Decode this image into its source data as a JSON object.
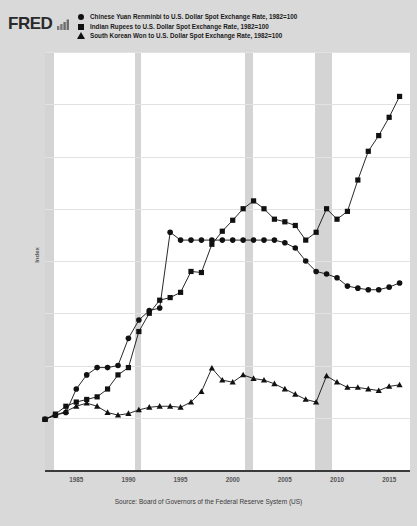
{
  "header": {
    "logo_text": "FRED",
    "logo_mark_icon": "mini-bar-chart-icon"
  },
  "legend": {
    "position": "top",
    "items": [
      {
        "marker": "circle",
        "label": "Chinese Yuan Renminbi to U.S. Dollar Spot Exchange Rate, 1982=100"
      },
      {
        "marker": "square",
        "label": "Indian Rupees to U.S. Dollar Spot Exchange Rate, 1982=100"
      },
      {
        "marker": "triangle",
        "label": "South Korean Won to U.S. Dollar Spot Exchange Rate, 1982=100"
      }
    ]
  },
  "source": {
    "text": "Source: Board of Governors of the Federal Reserve System (US)"
  },
  "chart_data": {
    "type": "line",
    "title": "",
    "xlabel": "",
    "ylabel": "Index",
    "xlim": [
      1982,
      2017
    ],
    "ylim": [
      0,
      800
    ],
    "grid": true,
    "legend_position": "top",
    "yticks": [
      0,
      100,
      200,
      300,
      400,
      500,
      600,
      700,
      800
    ],
    "xticks": [
      1985,
      1990,
      1995,
      2000,
      2005,
      2010,
      2015
    ],
    "marker_color": "#111111",
    "line_color": "#111111",
    "recession_color": "#d4d4d4",
    "recession_bands": [
      {
        "start": 1981.6,
        "end": 1982.9
      },
      {
        "start": 1990.6,
        "end": 1991.2
      },
      {
        "start": 2001.2,
        "end": 2001.9
      },
      {
        "start": 2007.9,
        "end": 2009.5
      }
    ],
    "x": [
      1982,
      1983,
      1984,
      1985,
      1986,
      1987,
      1988,
      1989,
      1990,
      1991,
      1992,
      1993,
      1994,
      1995,
      1996,
      1997,
      1998,
      1999,
      2000,
      2001,
      2002,
      2003,
      2004,
      2005,
      2006,
      2007,
      2008,
      2009,
      2010,
      2011,
      2012,
      2013,
      2014,
      2015,
      2016
    ],
    "series": [
      {
        "name": "Chinese Yuan Renminbi to U.S. Dollar Spot Exchange Rate, 1982=100",
        "marker": "circle",
        "values": [
          97,
          105,
          110,
          155,
          182,
          196,
          196,
          200,
          252,
          287,
          305,
          310,
          455,
          440,
          440,
          440,
          440,
          440,
          440,
          440,
          440,
          440,
          440,
          435,
          425,
          400,
          380,
          375,
          368,
          352,
          348,
          345,
          345,
          350,
          358
        ]
      },
      {
        "name": "Indian Rupees to U.S. Dollar Spot Exchange Rate, 1982=100",
        "marker": "square",
        "values": [
          97,
          107,
          122,
          130,
          135,
          140,
          155,
          182,
          196,
          265,
          300,
          325,
          330,
          340,
          380,
          378,
          432,
          457,
          478,
          500,
          515,
          500,
          480,
          475,
          468,
          440,
          455,
          500,
          480,
          495,
          555,
          610,
          640,
          675,
          715
        ]
      },
      {
        "name": "South Korean Won to U.S. Dollar Spot Exchange Rate, 1982=100",
        "marker": "triangle",
        "values": [
          97,
          105,
          112,
          122,
          128,
          122,
          110,
          105,
          108,
          115,
          120,
          122,
          122,
          120,
          130,
          150,
          195,
          172,
          168,
          182,
          175,
          172,
          165,
          155,
          145,
          135,
          130,
          180,
          168,
          158,
          158,
          155,
          152,
          160,
          163
        ]
      }
    ]
  }
}
